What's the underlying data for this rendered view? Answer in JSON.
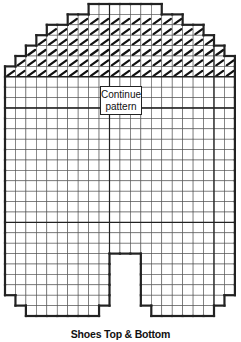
{
  "diagram": {
    "title": "Shoes Top & Bottom",
    "note_line1": "Continue",
    "note_line2": "pattern",
    "grid": {
      "origin_x": 5,
      "origin_y": 4,
      "cell_w": 10.45,
      "cell_h": 10.4,
      "columns": 22,
      "top_rows": [
        {
          "from": 8,
          "to": 15,
          "stitched": false
        },
        {
          "from": 6,
          "to": 17,
          "stitched": true
        },
        {
          "from": 4,
          "to": 19,
          "stitched": true
        },
        {
          "from": 3,
          "to": 20,
          "stitched": true
        },
        {
          "from": 2,
          "to": 21,
          "stitched": true
        },
        {
          "from": 1,
          "to": 22,
          "stitched": true
        },
        {
          "from": 0,
          "to": 22,
          "stitched": true
        }
      ],
      "full_rows_end": 24,
      "notch": {
        "from_col": 10,
        "to_col": 13,
        "start_row": 24
      },
      "bottom_rows": [
        {
          "left_from": 0,
          "left_to": 10,
          "right_from": 13,
          "right_to": 22,
          "count": 4
        },
        {
          "left_from": 1,
          "left_to": 10,
          "right_from": 13,
          "right_to": 21,
          "count": 1
        },
        {
          "left_from": 2,
          "left_to": 9,
          "right_from": 14,
          "right_to": 20,
          "count": 1
        }
      ],
      "heavy_h_rows": [
        7,
        10,
        21
      ],
      "heavy_v_cols": [
        10,
        20
      ]
    },
    "colors": {
      "line": "#222222",
      "grid": "#555555",
      "stitch": "#111111",
      "bg": "#ffffff"
    }
  }
}
